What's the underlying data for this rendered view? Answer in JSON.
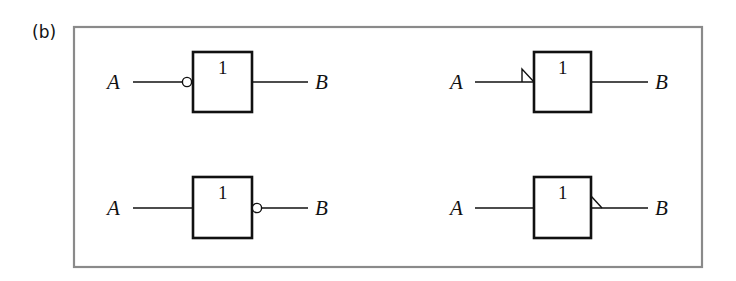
{
  "figure": {
    "panel_label": "(b)",
    "frame_color": "#8a8a8a",
    "line_color": "#111111"
  },
  "gates": [
    {
      "id": "top-left",
      "function_label": "1",
      "input": "A",
      "output": "B",
      "negation": "input-bubble"
    },
    {
      "id": "top-right",
      "function_label": "1",
      "input": "A",
      "output": "B",
      "negation": "input-polarity-triangle"
    },
    {
      "id": "bottom-left",
      "function_label": "1",
      "input": "A",
      "output": "B",
      "negation": "output-bubble"
    },
    {
      "id": "bottom-right",
      "function_label": "1",
      "input": "A",
      "output": "B",
      "negation": "output-polarity-triangle"
    }
  ]
}
